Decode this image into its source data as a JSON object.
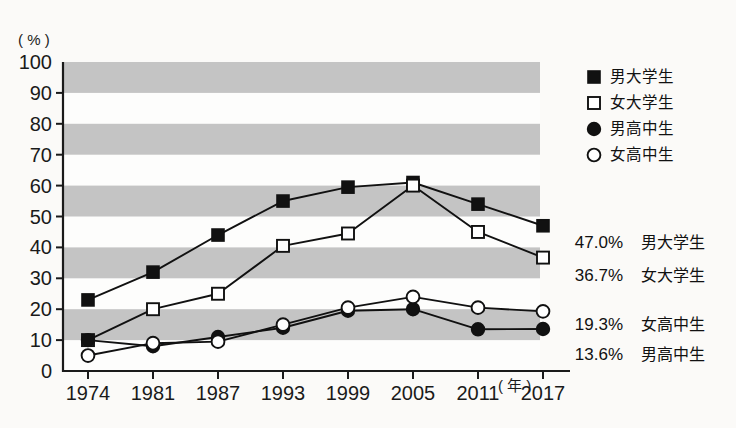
{
  "chart_data": {
    "type": "line",
    "title": "",
    "xlabel": "年",
    "ylabel": "%",
    "y_unit_label": "( % )",
    "x_unit_label": "( 年 )",
    "categories": [
      "1974",
      "1981",
      "1987",
      "1993",
      "1999",
      "2005",
      "2011",
      "2017"
    ],
    "ylim": [
      0,
      100
    ],
    "y_ticks": [
      "0",
      "10",
      "20",
      "30",
      "40",
      "50",
      "60",
      "70",
      "80",
      "90",
      "100"
    ],
    "grid": "horizontal-bands",
    "legend_position": "right-top",
    "series": [
      {
        "name": "男大学生",
        "marker": "filled-square",
        "values": [
          23.0,
          32.0,
          44.0,
          55.0,
          59.5,
          61.0,
          54.0,
          47.0
        ]
      },
      {
        "name": "女大学生",
        "marker": "open-square",
        "values": [
          10.0,
          20.0,
          25.0,
          40.5,
          44.5,
          60.0,
          45.0,
          36.7
        ]
      },
      {
        "name": "男高中生",
        "marker": "filled-circle",
        "values": [
          10.0,
          8.0,
          11.0,
          14.0,
          19.5,
          20.0,
          13.5,
          13.6
        ]
      },
      {
        "name": "女高中生",
        "marker": "open-circle",
        "values": [
          5.0,
          9.0,
          9.5,
          15.0,
          20.5,
          24.0,
          20.5,
          19.3
        ]
      }
    ],
    "annotations": [
      {
        "value": "47.0%",
        "label": "男大学生"
      },
      {
        "value": "36.7%",
        "label": "女大学生"
      },
      {
        "value": "19.3%",
        "label": "女高中生"
      },
      {
        "value": "13.6%",
        "label": "男高中生"
      }
    ]
  },
  "legend": {
    "items": [
      {
        "label": "男大学生",
        "marker": "filled-square"
      },
      {
        "label": "女大学生",
        "marker": "open-square"
      },
      {
        "label": "男高中生",
        "marker": "filled-circle"
      },
      {
        "label": "女高中生",
        "marker": "open-circle"
      }
    ]
  },
  "colors": {
    "band": "#c4c4c4",
    "ink": "#111111",
    "background": "#fbfaf8"
  }
}
